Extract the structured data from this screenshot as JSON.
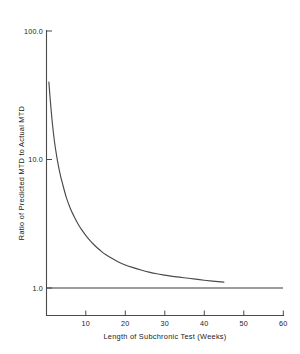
{
  "chart_data": {
    "type": "line",
    "title": "",
    "xlabel": "Length of Subchronic Test (Weeks)",
    "ylabel": "Ratio of Predicted MTD to Actual MTD",
    "xlim": [
      0,
      60
    ],
    "ylim": [
      1.0,
      100.0
    ],
    "yscale": "log",
    "xscale": "linear",
    "grid": false,
    "legend": null,
    "xticks": [
      10,
      20,
      30,
      40,
      50,
      60
    ],
    "xtick_labels": [
      "10",
      "20",
      "30",
      "40",
      "50",
      "60"
    ],
    "yticks": [
      1.0,
      10.0,
      100.0
    ],
    "ytick_labels": [
      "1.0",
      "10.0",
      "100.0"
    ],
    "series": [
      {
        "name": "Predicted/Actual MTD ratio",
        "x": [
          0.6,
          1.0,
          1.5,
          2.0,
          2.5,
          3.0,
          3.5,
          4.0,
          5.0,
          6.0,
          7.0,
          8.0,
          9.0,
          10.0,
          11.0,
          12.0,
          13.0,
          14.0,
          15.0,
          16.0,
          18.0,
          20.0,
          22.0,
          24.0,
          26.0,
          28.0,
          30.0,
          33.0,
          36.0,
          40.0,
          45.0
        ],
        "values": [
          40.0,
          28.0,
          19.0,
          14.0,
          11.0,
          9.0,
          7.6,
          6.6,
          5.1,
          4.2,
          3.6,
          3.15,
          2.82,
          2.56,
          2.35,
          2.18,
          2.04,
          1.92,
          1.82,
          1.74,
          1.61,
          1.51,
          1.44,
          1.38,
          1.33,
          1.29,
          1.26,
          1.22,
          1.19,
          1.15,
          1.11
        ]
      },
      {
        "name": "unity reference line",
        "x": [
          0,
          60
        ],
        "values": [
          1.0,
          1.0
        ]
      }
    ],
    "annotations": []
  },
  "figure": {
    "background_color": "#ffffff",
    "line_color": "#4a4a4a",
    "text_color": "#1a1a1a"
  }
}
